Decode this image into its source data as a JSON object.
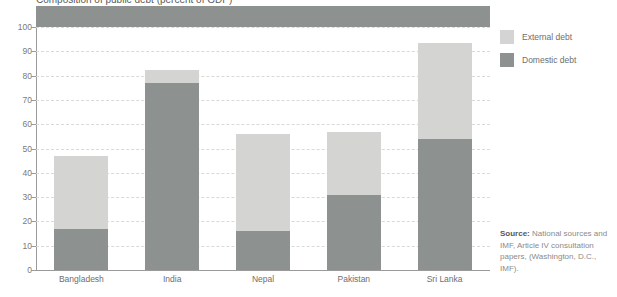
{
  "figure": {
    "title_fragment": "Composition of public debt (percent of GDP)"
  },
  "legend": {
    "position": "right",
    "items": [
      {
        "label": "External debt",
        "color": "#d4d4d2",
        "key": "external"
      },
      {
        "label": "Domestic debt",
        "color": "#8d9190",
        "key": "domestic"
      }
    ]
  },
  "source": {
    "label": "Source:",
    "text": " National sources and IMF, Article IV consultation papers, (Washington, D.C., IMF)."
  },
  "chart_data": {
    "type": "bar",
    "stacked": true,
    "title": "Composition of public debt (percent of GDP)",
    "xlabel": "",
    "ylabel": "",
    "ylim": [
      0,
      100
    ],
    "yticks": [
      0,
      10,
      20,
      30,
      40,
      50,
      60,
      70,
      80,
      90,
      100
    ],
    "ytick_labels": [
      "0",
      "10",
      "20",
      "30",
      "40",
      "50",
      "60",
      "70",
      "80",
      "90",
      "100"
    ],
    "grid": true,
    "grid_style": "dashed-horizontal",
    "categories": [
      "Bangladesh",
      "India",
      "Nepal",
      "Pakistan",
      "Sri Lanka"
    ],
    "series": [
      {
        "name": "Domestic debt",
        "color": "#8d9190",
        "values": [
          17,
          77,
          16,
          31,
          54
        ]
      },
      {
        "name": "External debt",
        "color": "#d4d4d2",
        "values": [
          30,
          5.5,
          40,
          26,
          39.5
        ]
      }
    ],
    "totals": [
      47,
      82.5,
      56,
      57,
      93.5
    ]
  }
}
